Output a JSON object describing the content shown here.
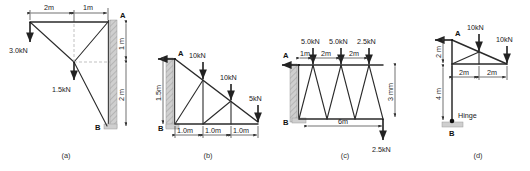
{
  "figure": {
    "type": "engineering-structural-diagram-set",
    "panels": [
      {
        "id": "a",
        "caption": "(a)",
        "nodes": [
          {
            "label": "A"
          },
          {
            "label": "B"
          }
        ],
        "loads": [
          {
            "value": "3.0kN",
            "direction": "down"
          },
          {
            "value": "1.5kN",
            "direction": "down"
          }
        ],
        "dimensions": [
          {
            "value": "2m",
            "orientation": "horizontal"
          },
          {
            "value": "1m",
            "orientation": "horizontal"
          },
          {
            "value": "1 m",
            "orientation": "vertical"
          },
          {
            "value": "2 m",
            "orientation": "vertical"
          }
        ],
        "support": "fixed-wall"
      },
      {
        "id": "b",
        "caption": "(b)",
        "nodes": [
          {
            "label": "A"
          },
          {
            "label": "B"
          }
        ],
        "loads": [
          {
            "value": "10kN",
            "direction": "down"
          },
          {
            "value": "10kN",
            "direction": "down"
          },
          {
            "value": "5kN",
            "direction": "down"
          }
        ],
        "dimensions": [
          {
            "value": "1.0m",
            "orientation": "horizontal"
          },
          {
            "value": "1.0m",
            "orientation": "horizontal"
          },
          {
            "value": "1.0m",
            "orientation": "horizontal"
          },
          {
            "value": "1.5m",
            "orientation": "vertical"
          }
        ],
        "support": "fixed-wall"
      },
      {
        "id": "c",
        "caption": "(c)",
        "nodes": [
          {
            "label": "A"
          },
          {
            "label": "B"
          }
        ],
        "loads": [
          {
            "value": "5.0kN",
            "direction": "down"
          },
          {
            "value": "5.0kN",
            "direction": "down"
          },
          {
            "value": "2.5kN",
            "direction": "down"
          },
          {
            "value": "2.5kN",
            "direction": "down"
          }
        ],
        "dimensions": [
          {
            "value": "1m",
            "orientation": "horizontal"
          },
          {
            "value": "2m",
            "orientation": "horizontal"
          },
          {
            "value": "2m",
            "orientation": "horizontal"
          },
          {
            "value": "6m",
            "orientation": "horizontal"
          },
          {
            "value": "3 mm",
            "orientation": "vertical"
          }
        ],
        "support": "fixed-wall"
      },
      {
        "id": "d",
        "caption": "(d)",
        "nodes": [
          {
            "label": "A"
          },
          {
            "label": "B"
          }
        ],
        "loads": [
          {
            "value": "10kN",
            "direction": "down"
          },
          {
            "value": "10kN",
            "direction": "down"
          }
        ],
        "dimensions": [
          {
            "value": "2m",
            "orientation": "horizontal"
          },
          {
            "value": "2m",
            "orientation": "horizontal"
          },
          {
            "value": "2 m",
            "orientation": "vertical"
          },
          {
            "value": "4 m",
            "orientation": "vertical"
          }
        ],
        "annotations": [
          {
            "label": "Hinge"
          }
        ],
        "support": "hinge-base"
      }
    ]
  }
}
